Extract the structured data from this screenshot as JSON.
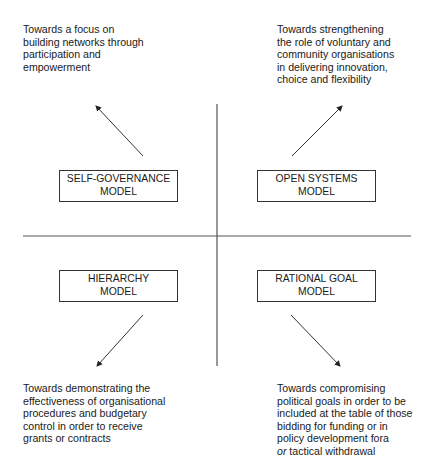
{
  "diagram": {
    "type": "quadrant",
    "axes": {
      "vertical": {
        "x": 217,
        "y1": 104,
        "y2": 366
      },
      "horizontal": {
        "y": 236,
        "x1": 23,
        "x2": 411
      }
    },
    "quadrants": {
      "top_left": {
        "model_lines": [
          "SELF-GOVERNANCE",
          "MODEL"
        ],
        "description_lines": [
          "Towards a focus on",
          "building networks through",
          "participation and",
          "empowerment"
        ],
        "arrow_direction": "up-left"
      },
      "top_right": {
        "model_lines": [
          "OPEN SYSTEMS",
          "MODEL"
        ],
        "description_lines": [
          "Towards strengthening",
          "the role of voluntary and",
          "community organisations",
          "in delivering innovation,",
          "choice and flexibility"
        ],
        "arrow_direction": "up-right"
      },
      "bottom_left": {
        "model_lines": [
          "HIERARCHY",
          "MODEL"
        ],
        "description_lines": [
          "Towards demonstrating the",
          "effectiveness of organisational",
          "procedures and budgetary",
          "control in order to receive",
          "grants or contracts"
        ],
        "arrow_direction": "down-left"
      },
      "bottom_right": {
        "model_lines": [
          "RATIONAL GOAL",
          "MODEL"
        ],
        "description_lines": [
          "Towards compromising",
          "political goals in order to be",
          "included at the table of those",
          "bidding for funding or in",
          "policy development fora"
        ],
        "last_line_italic": "or",
        "last_line_rest": " tactical withdrawal",
        "arrow_direction": "down-right"
      }
    },
    "colors": {
      "line": "#555555",
      "text": "#1a1a1a",
      "box_border": "#333333",
      "background": "#ffffff"
    }
  }
}
